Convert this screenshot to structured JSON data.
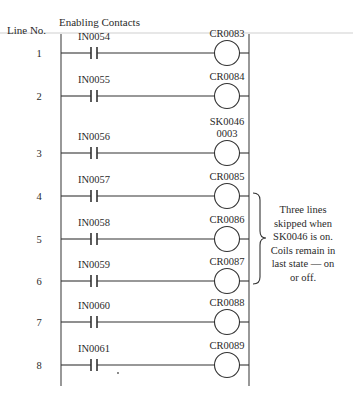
{
  "header": {
    "line_no_label": "Line No.",
    "contacts_label": "Enabling Contacts"
  },
  "rungs": [
    {
      "line": "1",
      "contact": "IN0054",
      "coil": [
        "CR0083"
      ]
    },
    {
      "line": "2",
      "contact": "IN0055",
      "coil": [
        "CR0084"
      ]
    },
    {
      "line": "3",
      "contact": "IN0056",
      "coil": [
        "SK0046",
        "0003"
      ]
    },
    {
      "line": "4",
      "contact": "IN0057",
      "coil": [
        "CR0085"
      ]
    },
    {
      "line": "5",
      "contact": "IN0058",
      "coil": [
        "CR0086"
      ]
    },
    {
      "line": "6",
      "contact": "IN0059",
      "coil": [
        "CR0087"
      ]
    },
    {
      "line": "7",
      "contact": "IN0060",
      "coil": [
        "CR0088"
      ]
    },
    {
      "line": "8",
      "contact": "IN0061",
      "coil": [
        "CR0089"
      ]
    }
  ],
  "annotation": {
    "brace_spans_lines": [
      "4",
      "6"
    ],
    "lines": [
      "Three lines",
      "skipped when",
      "SK0046 is on.",
      "Coils remain in",
      "last state — on",
      "or off."
    ]
  },
  "colors": {
    "ink": "#333333",
    "paper": "#ffffff",
    "faint_rule": "#cfcfcf"
  }
}
